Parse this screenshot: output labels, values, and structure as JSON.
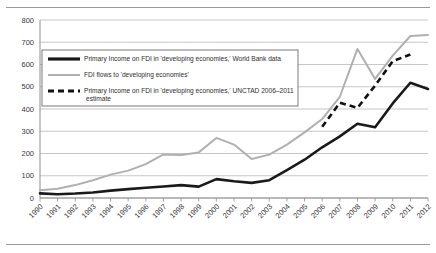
{
  "chart_data": {
    "type": "line",
    "title": "",
    "subtitle": "",
    "xlabel": "",
    "ylabel": "",
    "xlim": [
      1990,
      2012
    ],
    "ylim": [
      0,
      800
    ],
    "ytick_step": 100,
    "grid": true,
    "legend_position": "upper-left-inside",
    "categories": [
      "1990",
      "1991",
      "1992",
      "1993",
      "1994",
      "1995",
      "1996",
      "1997",
      "1998",
      "1999",
      "2000",
      "2001",
      "2002",
      "2003",
      "2004",
      "2005",
      "2006",
      "2007",
      "2008",
      "2009",
      "2010",
      "2011",
      "2012"
    ],
    "yticks": [
      "0",
      "100",
      "200",
      "300",
      "400",
      "500",
      "600",
      "700",
      "800"
    ],
    "series": [
      {
        "name": "Primary Income on FDI in 'developing economies,' World Bank data",
        "key": "world_bank",
        "style": "solid-black",
        "color": "#1a1a1a",
        "x": [
          1990,
          1991,
          1992,
          1993,
          1994,
          1995,
          1996,
          1997,
          1998,
          1999,
          2000,
          2001,
          2002,
          2003,
          2004,
          2005,
          2006,
          2007,
          2008,
          2009,
          2010,
          2011,
          2012
        ],
        "values": [
          21,
          17,
          20,
          25,
          33,
          40,
          46,
          52,
          58,
          51,
          85,
          75,
          68,
          80,
          125,
          172,
          228,
          277,
          334,
          318,
          425,
          518,
          490
        ]
      },
      {
        "name": "FDI flows to 'developing economies'",
        "key": "fdi_flows",
        "style": "solid-gray",
        "color": "#b0b0b0",
        "x": [
          1990,
          1991,
          1992,
          1993,
          1994,
          1995,
          1996,
          1997,
          1998,
          1999,
          2000,
          2001,
          2002,
          2003,
          2004,
          2005,
          2006,
          2007,
          2008,
          2009,
          2010,
          2011,
          2012
        ],
        "values": [
          35,
          42,
          58,
          80,
          105,
          123,
          152,
          196,
          193,
          205,
          270,
          240,
          175,
          195,
          240,
          295,
          355,
          455,
          670,
          535,
          640,
          728,
          733
        ]
      },
      {
        "name": "Primary Income on FDI in 'developing economies,' UNCTAD 2006–2011 estimate",
        "key": "unctad_estimate",
        "style": "dashed-black",
        "color": "#111111",
        "x": [
          2006,
          2007,
          2008,
          2009,
          2010,
          2011
        ],
        "values": [
          320,
          428,
          405,
          505,
          615,
          645
        ]
      }
    ],
    "annotations": []
  },
  "legend": {
    "entries": [
      {
        "label": "Primary Income on FDI in 'developing economies,' World Bank data",
        "swatch": "solid-black-thick"
      },
      {
        "label": "FDI flows to 'developing economies'",
        "swatch": "solid-gray"
      },
      {
        "label": "Primary Income on FDI in 'developing economies,'  UNCTAD 2006–2011",
        "swatch": "dashed-black"
      },
      {
        "label": "estimate",
        "swatch": "none"
      }
    ]
  }
}
